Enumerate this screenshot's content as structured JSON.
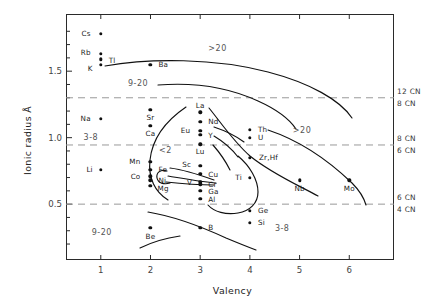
{
  "chart_data": {
    "type": "scatter",
    "title": "",
    "xlabel": "Valency",
    "ylabel": "Ionic radius Å",
    "xlim": [
      0.3,
      6.9
    ],
    "ylim": [
      0.08,
      1.93
    ],
    "xticks": [
      1,
      2,
      3,
      4,
      5,
      6
    ],
    "xticklabels": [
      "1",
      "2",
      "3",
      "4",
      "5",
      "6"
    ],
    "yticks": [
      0.5,
      1.0,
      1.5
    ],
    "yticklabels": [
      "0.5",
      "1.0",
      "1.5"
    ],
    "yminorticks": [
      0.2,
      0.3,
      0.4,
      0.6,
      0.7,
      0.8,
      0.9,
      1.1,
      1.2,
      1.3,
      1.4,
      1.6,
      1.7,
      1.8
    ],
    "grid": false,
    "legend_position": "none",
    "points": [
      {
        "label": "Cs",
        "x": 1.0,
        "y": 1.78,
        "lx": -10,
        "ly": 0
      },
      {
        "label": "Rb",
        "x": 1.0,
        "y": 1.63,
        "lx": -10,
        "ly": -1
      },
      {
        "label": "Tl",
        "x": 1.0,
        "y": 1.59,
        "lx": 8,
        "ly": 2
      },
      {
        "label": "K",
        "x": 1.0,
        "y": 1.55,
        "lx": -8,
        "ly": 4
      },
      {
        "label": "Ba",
        "x": 2.0,
        "y": 1.55,
        "lx": 8,
        "ly": 0
      },
      {
        "label": "Na",
        "x": 1.0,
        "y": 1.14,
        "lx": -10,
        "ly": 0
      },
      {
        "label": "Sr",
        "x": 2.0,
        "y": 1.21,
        "lx": 0,
        "ly": 8
      },
      {
        "label": "Ca",
        "x": 2.0,
        "y": 1.09,
        "lx": 0,
        "ly": 8
      },
      {
        "label": "La",
        "x": 3.0,
        "y": 1.19,
        "lx": 0,
        "ly": -6
      },
      {
        "label": "Nd",
        "x": 3.0,
        "y": 1.12,
        "lx": 8,
        "ly": 0
      },
      {
        "label": "Eu",
        "x": 3.0,
        "y": 1.05,
        "lx": -10,
        "ly": 0
      },
      {
        "label": "Y",
        "x": 3.0,
        "y": 1.02,
        "lx": 8,
        "ly": 1
      },
      {
        "label": "Lu",
        "x": 3.0,
        "y": 0.95,
        "lx": 0,
        "ly": 8
      },
      {
        "label": "Th",
        "x": 4.0,
        "y": 1.06,
        "lx": 8,
        "ly": 0
      },
      {
        "label": "U",
        "x": 4.0,
        "y": 1.0,
        "lx": 8,
        "ly": 0
      },
      {
        "label": "Zr,Hf",
        "x": 4.0,
        "y": 0.85,
        "lx": 9,
        "ly": 0
      },
      {
        "label": "Li",
        "x": 1.0,
        "y": 0.76,
        "lx": -8,
        "ly": 0
      },
      {
        "label": "Mn",
        "x": 2.0,
        "y": 0.82,
        "lx": -10,
        "ly": 0
      },
      {
        "label": "Fe",
        "x": 2.0,
        "y": 0.76,
        "lx": 8,
        "ly": 0
      },
      {
        "label": "Co",
        "x": 2.0,
        "y": 0.71,
        "lx": -10,
        "ly": 1
      },
      {
        "label": "Ni",
        "x": 2.0,
        "y": 0.68,
        "lx": 8,
        "ly": 1
      },
      {
        "label": "Mg",
        "x": 2.0,
        "y": 0.64,
        "lx": 7,
        "ly": 3
      },
      {
        "label": "Sc",
        "x": 3.0,
        "y": 0.79,
        "lx": -9,
        "ly": -1
      },
      {
        "label": "Cu",
        "x": 3.0,
        "y": 0.73,
        "lx": 8,
        "ly": 1
      },
      {
        "label": "V",
        "x": 3.0,
        "y": 0.67,
        "lx": -8,
        "ly": 1
      },
      {
        "label": "Cr",
        "x": 3.0,
        "y": 0.65,
        "lx": 8,
        "ly": 1
      },
      {
        "label": "Ga",
        "x": 3.0,
        "y": 0.6,
        "lx": 8,
        "ly": 1
      },
      {
        "label": "Al",
        "x": 3.0,
        "y": 0.54,
        "lx": 8,
        "ly": 1
      },
      {
        "label": "Ti",
        "x": 4.0,
        "y": 0.7,
        "lx": -8,
        "ly": 0
      },
      {
        "label": "Nb",
        "x": 5.0,
        "y": 0.68,
        "lx": 0,
        "ly": 9
      },
      {
        "label": "Mo",
        "x": 6.0,
        "y": 0.68,
        "lx": 0,
        "ly": 9
      },
      {
        "label": "Ge",
        "x": 4.0,
        "y": 0.45,
        "lx": 8,
        "ly": 0
      },
      {
        "label": "Si",
        "x": 4.0,
        "y": 0.36,
        "lx": 8,
        "ly": 0
      },
      {
        "label": "Be",
        "x": 2.0,
        "y": 0.32,
        "lx": 0,
        "ly": 9
      },
      {
        "label": "B",
        "x": 3.0,
        "y": 0.32,
        "lx": 8,
        "ly": 0
      }
    ],
    "region_labels": [
      {
        "text": "9-20",
        "x": 1.75,
        "y": 1.4
      },
      {
        "text": ">20",
        "x": 3.35,
        "y": 1.67
      },
      {
        "text": ">20",
        "x": 5.05,
        "y": 1.05
      },
      {
        "text": "3-8",
        "x": 0.8,
        "y": 1.0
      },
      {
        "text": "<2",
        "x": 2.3,
        "y": 0.9
      },
      {
        "text": "9-20",
        "x": 1.02,
        "y": 0.28
      },
      {
        "text": "3-8",
        "x": 4.65,
        "y": 0.31
      }
    ],
    "cn_lines": [
      {
        "y": 1.3,
        "label_above": "12 CN",
        "label_below": "8 CN"
      },
      {
        "y": 0.945,
        "label_above": "8 CN",
        "label_below": "6 CN"
      },
      {
        "y": 0.5,
        "label_above": "6 CN",
        "label_below": "4 CN"
      }
    ],
    "curve_description": "Hand-drawn closed and open contours separating coordination-number / ligancy fields"
  },
  "axis": {
    "x_title": "Valency",
    "y_title": "Ionic radius Å"
  },
  "style": {
    "point_color": "#111111",
    "frame_color": "#2a2a2a",
    "dashed_color": "#999999",
    "curve_color": "#111111",
    "background": "#ffffff"
  }
}
